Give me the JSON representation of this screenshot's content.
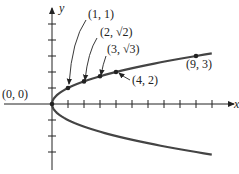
{
  "figure": {
    "equation": "x = y^2",
    "axes": {
      "x_label": "x",
      "y_label": "y",
      "x_ticks": [
        1,
        2,
        3,
        4,
        5,
        6,
        7,
        8,
        9,
        10
      ],
      "y_ticks": [
        -3,
        -2,
        -1,
        1,
        2,
        3,
        4,
        5
      ]
    },
    "curve_domain_y": [
      -3.16,
      3.16
    ],
    "points": [
      {
        "x": 0,
        "y": 0,
        "label": "(0, 0)"
      },
      {
        "x": 1,
        "y": 1,
        "label": "(1, 1)"
      },
      {
        "x": 2,
        "y": 1.414,
        "label": "(2, √2)"
      },
      {
        "x": 3,
        "y": 1.732,
        "label": "(3, √3)"
      },
      {
        "x": 4,
        "y": 2,
        "label": "(4, 2)"
      },
      {
        "x": 9,
        "y": 3,
        "label": "(9, 3)"
      }
    ],
    "colors": {
      "ink": "#222222",
      "curve": "#444444"
    }
  }
}
